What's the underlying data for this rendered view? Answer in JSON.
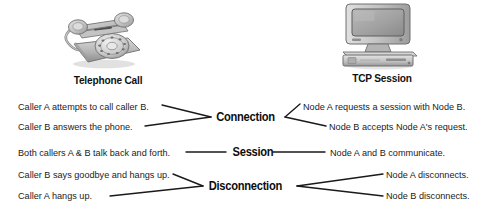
{
  "diagram": {
    "title_alt": "Telephone Call compared to TCP Session",
    "line_color": "#1a1a1a",
    "text_color": "#1b1b1b"
  },
  "columns": {
    "left": {
      "icon": "rotary-telephone-icon",
      "caption": "Telephone Call",
      "events": [
        "Caller A attempts to call caller B.",
        "Caller B answers the phone.",
        "Both callers A & B talk back and forth.",
        "Caller B says goodbye and hangs up.",
        "Caller A hangs up."
      ]
    },
    "right": {
      "icon": "desktop-computer-icon",
      "caption": "TCP Session",
      "events": [
        "Node A requests a session with Node B.",
        "Node B accepts Node A's request.",
        "Node A and B communicate.",
        "Node A disconnects.",
        "Node B disconnects."
      ]
    }
  },
  "phases": [
    {
      "label": "Connection"
    },
    {
      "label": "Session"
    },
    {
      "label": "Disconnection"
    }
  ]
}
